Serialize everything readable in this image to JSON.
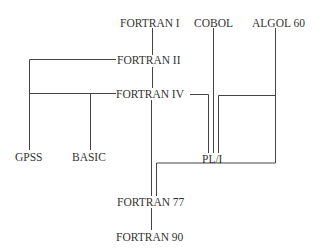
{
  "diagram": {
    "type": "language-family-tree",
    "nodes": {
      "fortran_i": "FORTRAN I",
      "cobol": "COBOL",
      "algol60": "ALGOL 60",
      "fortran_ii": "FORTRAN II",
      "fortran_iv": "FORTRAN IV",
      "gpss": "GPSS",
      "basic": "BASIC",
      "pl1": "PL/I",
      "fortran77": "FORTRAN 77",
      "fortran90": "FORTRAN 90"
    },
    "edges": [
      [
        "FORTRAN I",
        "FORTRAN II"
      ],
      [
        "FORTRAN II",
        "FORTRAN IV"
      ],
      [
        "FORTRAN II",
        "GPSS"
      ],
      [
        "FORTRAN IV",
        "GPSS"
      ],
      [
        "FORTRAN IV",
        "BASIC"
      ],
      [
        "FORTRAN IV",
        "PL/I"
      ],
      [
        "COBOL",
        "PL/I"
      ],
      [
        "ALGOL 60",
        "PL/I"
      ],
      [
        "FORTRAN IV",
        "FORTRAN 77"
      ],
      [
        "ALGOL 60",
        "FORTRAN 77"
      ],
      [
        "FORTRAN 77",
        "FORTRAN 90"
      ]
    ],
    "colors": {
      "line": "#444444",
      "text": "#333333",
      "background": "#ffffff"
    }
  }
}
